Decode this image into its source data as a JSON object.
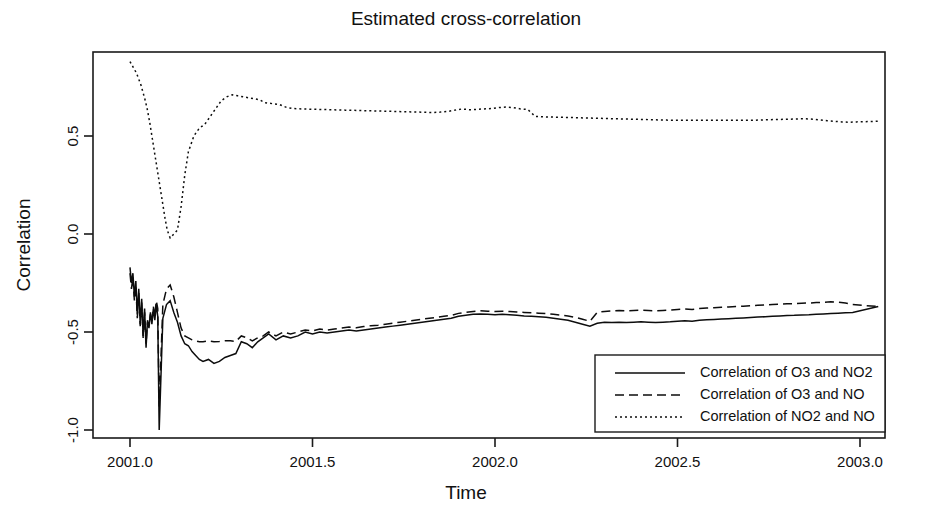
{
  "chart_data": {
    "type": "line",
    "title": "Estimated cross-correlation",
    "xlabel": "Time",
    "ylabel": "Correlation",
    "xlim": [
      2000.93,
      2003.05
    ],
    "ylim": [
      -1.05,
      0.95
    ],
    "grid": false,
    "legend_position": "bottom-right",
    "xticks": [
      2001.0,
      2001.5,
      2002.0,
      2002.5,
      2003.0
    ],
    "xtick_labels": [
      "2001.0",
      "2001.5",
      "2002.0",
      "2002.5",
      "2003.0"
    ],
    "yticks": [
      0.5,
      0.0,
      -0.5,
      -1.0
    ],
    "ytick_labels": [
      "0.5",
      "0.0",
      "-0.5",
      "-1.0"
    ],
    "series": [
      {
        "name": "Correlation of O3 and NO2",
        "style": "solid",
        "dash": "none",
        "color": "#0d0d0d",
        "x": [
          2001.0,
          2001.004,
          2001.008,
          2001.012,
          2001.016,
          2001.02,
          2001.024,
          2001.028,
          2001.032,
          2001.036,
          2001.04,
          2001.044,
          2001.048,
          2001.052,
          2001.056,
          2001.06,
          2001.064,
          2001.068,
          2001.072,
          2001.076,
          2001.08,
          2001.09,
          2001.1,
          2001.11,
          2001.12,
          2001.13,
          2001.14,
          2001.15,
          2001.16,
          2001.17,
          2001.18,
          2001.19,
          2001.2,
          2001.215,
          2001.23,
          2001.245,
          2001.26,
          2001.275,
          2001.29,
          2001.305,
          2001.32,
          2001.335,
          2001.35,
          2001.365,
          2001.38,
          2001.4,
          2001.42,
          2001.44,
          2001.46,
          2001.48,
          2001.5,
          2001.52,
          2001.54,
          2001.56,
          2001.58,
          2001.6,
          2001.62,
          2001.64,
          2001.66,
          2001.68,
          2001.7,
          2001.72,
          2001.74,
          2001.76,
          2001.78,
          2001.8,
          2001.82,
          2001.84,
          2001.86,
          2001.88,
          2001.9,
          2001.92,
          2001.94,
          2001.96,
          2001.98,
          2002.0,
          2002.02,
          2002.04,
          2002.06,
          2002.08,
          2002.1,
          2002.12,
          2002.14,
          2002.16,
          2002.18,
          2002.2,
          2002.22,
          2002.24,
          2002.26,
          2002.28,
          2002.3,
          2002.32,
          2002.34,
          2002.36,
          2002.38,
          2002.4,
          2002.42,
          2002.44,
          2002.46,
          2002.48,
          2002.5,
          2002.52,
          2002.54,
          2002.56,
          2002.58,
          2002.6,
          2002.62,
          2002.64,
          2002.66,
          2002.68,
          2002.7,
          2002.72,
          2002.74,
          2002.76,
          2002.78,
          2002.8,
          2002.82,
          2002.84,
          2002.86,
          2002.88,
          2002.9,
          2002.92,
          2002.94,
          2002.96,
          2002.98,
          3000.0
        ],
        "y": [
          -0.17,
          -0.25,
          -0.2,
          -0.32,
          -0.24,
          -0.41,
          -0.28,
          -0.46,
          -0.33,
          -0.52,
          -0.38,
          -0.58,
          -0.44,
          -0.48,
          -0.4,
          -0.46,
          -0.38,
          -0.44,
          -0.36,
          -0.42,
          -1.0,
          -0.43,
          -0.36,
          -0.34,
          -0.4,
          -0.45,
          -0.52,
          -0.56,
          -0.57,
          -0.6,
          -0.62,
          -0.64,
          -0.65,
          -0.64,
          -0.66,
          -0.65,
          -0.63,
          -0.62,
          -0.61,
          -0.55,
          -0.56,
          -0.58,
          -0.55,
          -0.53,
          -0.51,
          -0.54,
          -0.52,
          -0.53,
          -0.52,
          -0.5,
          -0.51,
          -0.5,
          -0.505,
          -0.5,
          -0.495,
          -0.49,
          -0.495,
          -0.49,
          -0.485,
          -0.48,
          -0.475,
          -0.47,
          -0.465,
          -0.46,
          -0.455,
          -0.45,
          -0.445,
          -0.44,
          -0.435,
          -0.43,
          -0.42,
          -0.415,
          -0.41,
          -0.408,
          -0.41,
          -0.412,
          -0.41,
          -0.412,
          -0.415,
          -0.418,
          -0.42,
          -0.422,
          -0.425,
          -0.43,
          -0.435,
          -0.44,
          -0.45,
          -0.46,
          -0.47,
          -0.455,
          -0.45,
          -0.452,
          -0.45,
          -0.452,
          -0.45,
          -0.448,
          -0.45,
          -0.452,
          -0.45,
          -0.448,
          -0.445,
          -0.443,
          -0.445,
          -0.44,
          -0.438,
          -0.436,
          -0.434,
          -0.432,
          -0.43,
          -0.428,
          -0.426,
          -0.424,
          -0.422,
          -0.42,
          -0.418,
          -0.416,
          -0.415,
          -0.413,
          -0.412,
          -0.41,
          -0.408,
          -0.406,
          -0.404,
          -0.402,
          -0.4,
          -0.37
        ]
      },
      {
        "name": "Correlation of O3 and NO",
        "style": "dashed",
        "dash": "9,5",
        "color": "#0d0d0d",
        "x": [
          2001.0,
          2001.004,
          2001.008,
          2001.012,
          2001.016,
          2001.02,
          2001.024,
          2001.028,
          2001.032,
          2001.036,
          2001.04,
          2001.044,
          2001.048,
          2001.052,
          2001.056,
          2001.06,
          2001.064,
          2001.068,
          2001.072,
          2001.076,
          2001.08,
          2001.09,
          2001.1,
          2001.11,
          2001.12,
          2001.13,
          2001.14,
          2001.15,
          2001.16,
          2001.17,
          2001.18,
          2001.19,
          2001.2,
          2001.215,
          2001.23,
          2001.245,
          2001.26,
          2001.275,
          2001.29,
          2001.305,
          2001.32,
          2001.335,
          2001.35,
          2001.365,
          2001.38,
          2001.4,
          2001.42,
          2001.44,
          2001.46,
          2001.48,
          2001.5,
          2001.52,
          2001.54,
          2001.56,
          2001.58,
          2001.6,
          2001.62,
          2001.64,
          2001.66,
          2001.68,
          2001.7,
          2001.72,
          2001.74,
          2001.76,
          2001.78,
          2001.8,
          2001.82,
          2001.84,
          2001.86,
          2001.88,
          2001.9,
          2001.92,
          2001.94,
          2001.96,
          2001.98,
          2002.0,
          2002.02,
          2002.04,
          2002.06,
          2002.08,
          2002.1,
          2002.12,
          2002.14,
          2002.16,
          2002.18,
          2002.2,
          2002.22,
          2002.24,
          2002.26,
          2002.28,
          2002.3,
          2002.32,
          2002.34,
          2002.36,
          2002.38,
          2002.4,
          2002.42,
          2002.44,
          2002.46,
          2002.48,
          2002.5,
          2002.52,
          2002.54,
          2002.56,
          2002.58,
          2002.6,
          2002.62,
          2002.64,
          2002.66,
          2002.68,
          2002.7,
          2002.72,
          2002.74,
          2002.76,
          2002.78,
          2002.8,
          2002.82,
          2002.84,
          2002.86,
          2002.88,
          2002.9,
          2002.92,
          2002.94,
          2002.96,
          2002.98,
          3000.0
        ],
        "y": [
          -0.2,
          -0.28,
          -0.22,
          -0.34,
          -0.26,
          -0.43,
          -0.3,
          -0.47,
          -0.35,
          -0.53,
          -0.4,
          -0.56,
          -0.45,
          -0.47,
          -0.41,
          -0.45,
          -0.37,
          -0.42,
          -0.34,
          -0.38,
          -0.88,
          -0.36,
          -0.28,
          -0.26,
          -0.32,
          -0.4,
          -0.48,
          -0.52,
          -0.53,
          -0.54,
          -0.545,
          -0.55,
          -0.55,
          -0.545,
          -0.55,
          -0.548,
          -0.545,
          -0.545,
          -0.548,
          -0.52,
          -0.53,
          -0.545,
          -0.53,
          -0.52,
          -0.5,
          -0.52,
          -0.5,
          -0.51,
          -0.5,
          -0.49,
          -0.495,
          -0.485,
          -0.49,
          -0.485,
          -0.48,
          -0.475,
          -0.478,
          -0.472,
          -0.468,
          -0.465,
          -0.46,
          -0.455,
          -0.45,
          -0.445,
          -0.44,
          -0.435,
          -0.43,
          -0.425,
          -0.42,
          -0.415,
          -0.405,
          -0.4,
          -0.395,
          -0.392,
          -0.394,
          -0.396,
          -0.394,
          -0.396,
          -0.398,
          -0.4,
          -0.402,
          -0.404,
          -0.406,
          -0.41,
          -0.414,
          -0.418,
          -0.425,
          -0.435,
          -0.445,
          -0.4,
          -0.395,
          -0.392,
          -0.39,
          -0.392,
          -0.39,
          -0.388,
          -0.39,
          -0.392,
          -0.39,
          -0.388,
          -0.385,
          -0.383,
          -0.385,
          -0.38,
          -0.378,
          -0.376,
          -0.374,
          -0.372,
          -0.37,
          -0.368,
          -0.366,
          -0.364,
          -0.362,
          -0.36,
          -0.358,
          -0.356,
          -0.355,
          -0.353,
          -0.352,
          -0.35,
          -0.348,
          -0.346,
          -0.348,
          -0.352,
          -0.36,
          -0.37
        ]
      },
      {
        "name": "Correlation of NO2 and NO",
        "style": "dotted",
        "dash": "2,3",
        "color": "#0d0d0d",
        "x": [
          2001.0,
          2001.006,
          2001.012,
          2001.018,
          2001.024,
          2001.03,
          2001.036,
          2001.042,
          2001.048,
          2001.054,
          2001.06,
          2001.066,
          2001.072,
          2001.078,
          2001.084,
          2001.09,
          2001.096,
          2001.102,
          2001.11,
          2001.12,
          2001.13,
          2001.14,
          2001.15,
          2001.16,
          2001.175,
          2001.19,
          2001.205,
          2001.22,
          2001.235,
          2001.25,
          2001.265,
          2001.28,
          2001.295,
          2001.31,
          2001.325,
          2001.34,
          2001.355,
          2001.37,
          2001.39,
          2001.41,
          2001.43,
          2001.45,
          2001.47,
          2001.49,
          2001.51,
          2001.53,
          2001.55,
          2001.57,
          2001.59,
          2001.61,
          2001.63,
          2001.65,
          2001.67,
          2001.69,
          2001.71,
          2001.73,
          2001.75,
          2001.77,
          2001.79,
          2001.81,
          2001.83,
          2001.85,
          2001.87,
          2001.89,
          2001.91,
          2001.93,
          2001.95,
          2001.97,
          2001.99,
          2002.01,
          2002.03,
          2002.05,
          2002.07,
          2002.09,
          2002.11,
          2002.13,
          2002.15,
          2002.17,
          2002.19,
          2002.21,
          2002.23,
          2002.25,
          2002.27,
          2002.29,
          2002.31,
          2002.33,
          2002.35,
          2002.37,
          2002.39,
          2002.41,
          2002.43,
          2002.45,
          2002.47,
          2002.49,
          2002.51,
          2002.53,
          2002.55,
          2002.57,
          2002.59,
          2002.61,
          2002.63,
          2002.65,
          2002.67,
          2002.69,
          2002.71,
          2002.73,
          2002.75,
          2002.77,
          2002.79,
          2002.81,
          2002.83,
          2002.85,
          2002.87,
          2002.89,
          2002.91,
          2002.93,
          2002.95,
          2002.97,
          2002.99,
          3000.0
        ],
        "y": [
          0.88,
          0.86,
          0.84,
          0.82,
          0.79,
          0.76,
          0.72,
          0.68,
          0.63,
          0.57,
          0.5,
          0.43,
          0.36,
          0.29,
          0.22,
          0.15,
          0.08,
          0.02,
          -0.02,
          0.0,
          0.02,
          0.14,
          0.3,
          0.42,
          0.5,
          0.54,
          0.56,
          0.6,
          0.64,
          0.68,
          0.7,
          0.71,
          0.705,
          0.7,
          0.695,
          0.69,
          0.685,
          0.67,
          0.665,
          0.66,
          0.645,
          0.64,
          0.638,
          0.637,
          0.636,
          0.635,
          0.634,
          0.633,
          0.632,
          0.631,
          0.63,
          0.629,
          0.628,
          0.627,
          0.626,
          0.625,
          0.624,
          0.623,
          0.622,
          0.621,
          0.62,
          0.622,
          0.625,
          0.632,
          0.638,
          0.634,
          0.636,
          0.638,
          0.64,
          0.645,
          0.648,
          0.645,
          0.638,
          0.635,
          0.6,
          0.598,
          0.597,
          0.596,
          0.595,
          0.594,
          0.593,
          0.592,
          0.591,
          0.59,
          0.589,
          0.588,
          0.587,
          0.586,
          0.585,
          0.584,
          0.583,
          0.582,
          0.581,
          0.58,
          0.58,
          0.58,
          0.58,
          0.58,
          0.58,
          0.58,
          0.58,
          0.58,
          0.58,
          0.58,
          0.58,
          0.582,
          0.583,
          0.584,
          0.585,
          0.586,
          0.587,
          0.588,
          0.586,
          0.582,
          0.578,
          0.575,
          0.572,
          0.57,
          0.572,
          0.575
        ]
      }
    ]
  },
  "legend": {
    "entries": [
      {
        "label": "Correlation of O3 and NO2",
        "style": "solid"
      },
      {
        "label": "Correlation of O3 and NO",
        "style": "dashed"
      },
      {
        "label": "Correlation of NO2 and NO",
        "style": "dotted"
      }
    ]
  }
}
